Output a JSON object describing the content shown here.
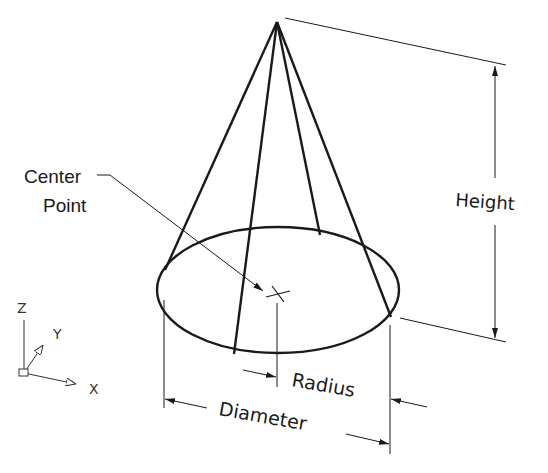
{
  "diagram": {
    "type": "cone-dimension-illustration",
    "labels": {
      "center_point_line1": "Center",
      "center_point_line2": "Point",
      "height": "Height",
      "radius": "Radius",
      "diameter": "Diameter"
    },
    "axes": {
      "z": "Z",
      "y": "Y",
      "x": "X"
    },
    "colors": {
      "line": "#1a1a1a",
      "background": "#ffffff"
    }
  }
}
